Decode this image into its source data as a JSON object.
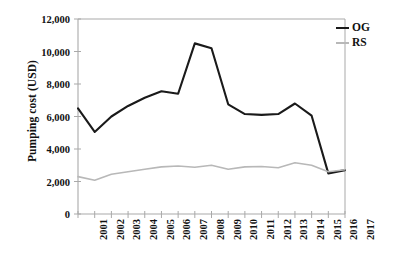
{
  "chart_data": {
    "type": "line",
    "title": "",
    "xlabel": "",
    "ylabel": "Pumping cost (USD)",
    "categories": [
      "2001",
      "2002",
      "2003",
      "2004",
      "2005",
      "2006",
      "2007",
      "2008",
      "2009",
      "2010",
      "2011",
      "2012",
      "2013",
      "2014",
      "2015",
      "2016",
      "2017"
    ],
    "x": [
      2001,
      2002,
      2003,
      2004,
      2005,
      2006,
      2007,
      2008,
      2009,
      2010,
      2011,
      2012,
      2013,
      2014,
      2015,
      2016,
      2017
    ],
    "ylim": [
      0,
      12000
    ],
    "xlim": [
      2001,
      2017
    ],
    "yticks": [
      0,
      2000,
      4000,
      6000,
      8000,
      10000,
      12000
    ],
    "ytick_labels": [
      "0",
      "2,000",
      "4,000",
      "6,000",
      "8,000",
      "10,000",
      "12,000"
    ],
    "grid": false,
    "legend_position": "top-right",
    "series": [
      {
        "name": "OG",
        "color": "#1a1a1a",
        "values": [
          6500,
          5050,
          6000,
          6650,
          7150,
          7550,
          7400,
          10500,
          10200,
          6750,
          6150,
          6100,
          6150,
          6800,
          6050,
          2500,
          2700
        ]
      },
      {
        "name": "RS",
        "color": "#b8b8b8",
        "values": [
          2300,
          2080,
          2450,
          2600,
          2750,
          2900,
          2950,
          2880,
          3000,
          2750,
          2900,
          2920,
          2850,
          3150,
          3000,
          2600,
          2720
        ]
      }
    ]
  },
  "legend": {
    "items": [
      {
        "label": "OG",
        "color": "#1a1a1a"
      },
      {
        "label": "RS",
        "color": "#b8b8b8"
      }
    ]
  }
}
